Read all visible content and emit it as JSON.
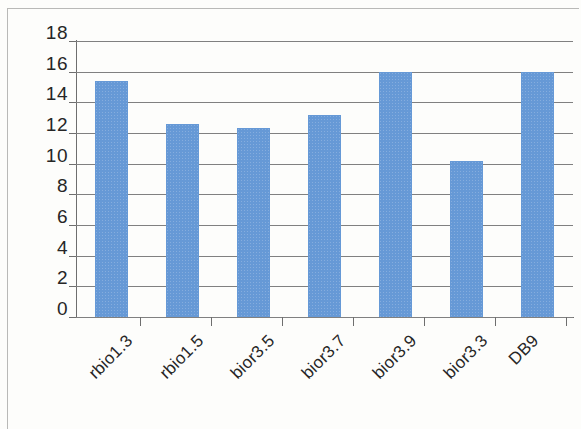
{
  "chart_data": {
    "type": "bar",
    "title": "",
    "subtitle": "",
    "xlabel": "",
    "ylabel": "",
    "categories": [
      "rbio1.3",
      "rbio1.5",
      "bior3.5",
      "bior3.7",
      "bior3.9",
      "bior3.3",
      "DB9"
    ],
    "values": [
      15.4,
      12.6,
      12.3,
      13.2,
      16.0,
      10.2,
      16.0
    ],
    "ylim": [
      0,
      18
    ],
    "ytick_step": 2,
    "yticks": [
      "18",
      "16",
      "14",
      "12",
      "10",
      "8",
      "6",
      "4",
      "2",
      "0"
    ],
    "ytick_values": [
      18,
      16,
      14,
      12,
      10,
      8,
      6,
      4,
      2,
      0
    ],
    "grid": true,
    "legend": false,
    "legend_position": "none",
    "series": [
      {
        "name": "",
        "color": "#6699D6",
        "values": [
          15.4,
          12.6,
          12.3,
          13.2,
          16.0,
          10.2,
          16.0
        ]
      }
    ]
  },
  "style": {
    "bar_color": "#6699D6",
    "gridline_color": "#808080",
    "axis_color": "#6E6E6E",
    "text_color": "#262626",
    "background_color": "#FDFDFB",
    "frame_color": "#B9B9B7"
  }
}
